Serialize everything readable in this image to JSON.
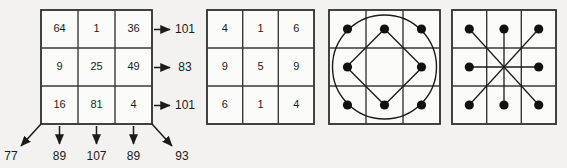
{
  "figure": {
    "background_color": "#f3f2f0",
    "ink_color": "#1b1b1b",
    "panel_count": 4
  },
  "panel1": {
    "name": "magic-square-with-sums",
    "grid": [
      [
        "64",
        "1",
        "36"
      ],
      [
        "9",
        "25",
        "49"
      ],
      [
        "16",
        "81",
        "4"
      ]
    ],
    "row_sums": [
      "101",
      "83",
      "101"
    ],
    "column_sums": [
      "89",
      "107",
      "89"
    ],
    "diagonal_sums": {
      "anti_diagonal": "77",
      "main_diagonal": "93"
    },
    "bottom_labels": [
      "77",
      "89",
      "107",
      "89",
      "93"
    ]
  },
  "panel2": {
    "name": "digit-grid",
    "grid": [
      [
        "4",
        "1",
        "6"
      ],
      [
        "9",
        "5",
        "9"
      ],
      [
        "6",
        "1",
        "4"
      ]
    ]
  },
  "panel3": {
    "name": "circle-and-diamond-dot-grid",
    "dot_cells": [
      [
        0,
        0
      ],
      [
        0,
        1
      ],
      [
        0,
        2
      ],
      [
        1,
        0
      ],
      [
        1,
        2
      ],
      [
        2,
        0
      ],
      [
        2,
        1
      ],
      [
        2,
        2
      ]
    ],
    "overlays": [
      "circle",
      "diamond"
    ],
    "diamond_vertices": [
      "top-center",
      "middle-right",
      "bottom-center",
      "middle-left"
    ]
  },
  "panel4": {
    "name": "asterisk-dot-grid",
    "dot_cells": [
      [
        0,
        0
      ],
      [
        0,
        1
      ],
      [
        0,
        2
      ],
      [
        1,
        0
      ],
      [
        1,
        2
      ],
      [
        2,
        0
      ],
      [
        2,
        1
      ],
      [
        2,
        2
      ]
    ],
    "overlays": [
      "vertical-line",
      "horizontal-line",
      "diagonal-line-nw-se",
      "diagonal-line-ne-sw"
    ]
  }
}
